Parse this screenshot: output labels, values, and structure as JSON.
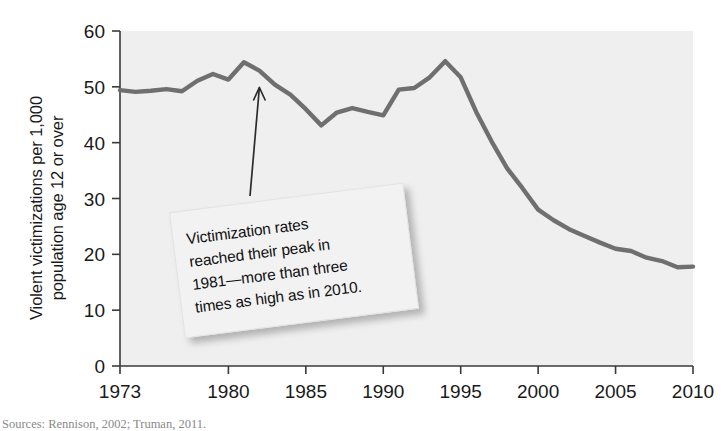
{
  "chart_data": {
    "type": "line",
    "title": "",
    "subtitle": "",
    "xlabel": "",
    "ylabel": "Violent victimizations per 1,000 population age 12 or over",
    "ylabel_lines": [
      "Violent victimizations per 1,000",
      "population age 12 or over"
    ],
    "xlim": [
      1973,
      2010
    ],
    "ylim": [
      0,
      60
    ],
    "ytick_values": [
      0,
      10,
      20,
      30,
      40,
      50,
      60
    ],
    "ytick_labels": [
      "0",
      "10",
      "20",
      "30",
      "40",
      "50",
      "60"
    ],
    "xtick_values": [
      1973,
      1980,
      1985,
      1990,
      1995,
      2000,
      2005,
      2010
    ],
    "xtick_labels": [
      "1973",
      "1980",
      "1985",
      "1990",
      "1995",
      "2000",
      "2005",
      "2010"
    ],
    "grid": false,
    "legend": "none",
    "line_color": "#6f6f6f",
    "plot_background": "#efefef",
    "axis_color": "#3a3a3a",
    "x": [
      1973,
      1974,
      1975,
      1976,
      1977,
      1978,
      1979,
      1980,
      1981,
      1982,
      1983,
      1984,
      1985,
      1986,
      1987,
      1988,
      1989,
      1990,
      1991,
      1992,
      1993,
      1994,
      1995,
      1996,
      1997,
      1998,
      1999,
      2000,
      2001,
      2002,
      2003,
      2004,
      2005,
      2006,
      2007,
      2008,
      2009,
      2010
    ],
    "values": [
      49.4,
      49.1,
      49.3,
      49.6,
      49.2,
      51.1,
      52.3,
      51.3,
      54.4,
      52.9,
      50.4,
      48.6,
      46.0,
      43.1,
      45.4,
      46.2,
      45.5,
      44.9,
      49.5,
      49.8,
      51.7,
      54.6,
      51.7,
      45.5,
      40.2,
      35.4,
      31.8,
      28.0,
      26.1,
      24.5,
      23.3,
      22.1,
      21.0,
      20.6,
      19.4,
      18.8,
      17.7,
      17.8
    ],
    "annotations": [
      {
        "id": "peak-callout",
        "text": "Victimization rates reached their peak in 1981—more than three times as high as in 2010.",
        "lines": [
          "Victimization rates",
          "reached their peak in",
          "1981—more than three",
          "times as high as in 2010."
        ],
        "points_to_year": 1982,
        "points_to_value": 50.6,
        "rotation_deg": -7.2
      }
    ]
  },
  "source": {
    "text": "Sources: Rennison, 2002; Truman, 2011."
  }
}
